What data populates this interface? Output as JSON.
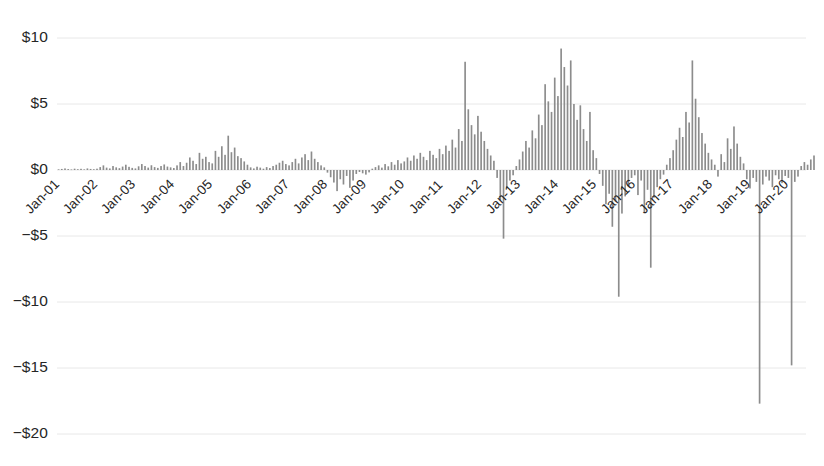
{
  "chart_data": {
    "type": "bar",
    "title": "",
    "subtitle": "",
    "xlabel": "",
    "ylabel": "",
    "ylim": [
      -20,
      11.5
    ],
    "xlim": [
      0,
      234
    ],
    "grid": true,
    "legend": false,
    "legend_position": "none",
    "bar_color": "#8c8c8c",
    "grid_color": "#e8e8e8",
    "axis_text_color": "#262626",
    "y_ticks": [
      10,
      5,
      0,
      -5,
      -10,
      -15,
      -20
    ],
    "y_tick_labels": [
      "$10",
      "$5",
      "$0",
      "−$5",
      "−$10",
      "−$15",
      "−$20"
    ],
    "x_tick_positions": [
      0,
      12,
      24,
      36,
      48,
      60,
      72,
      84,
      96,
      108,
      120,
      132,
      144,
      156,
      168,
      180,
      192,
      204,
      216,
      228
    ],
    "x_tick_labels": [
      "Jan-01",
      "Jan-02",
      "Jan-03",
      "Jan-04",
      "Jan-05",
      "Jan-06",
      "Jan-07",
      "Jan-08",
      "Jan-09",
      "Jan-10",
      "Jan-11",
      "Jan-12",
      "Jan-13",
      "Jan-14",
      "Jan-15",
      "Jan-16",
      "Jan-17",
      "Jan-18",
      "Jan-19",
      "Jan-20"
    ],
    "values": [
      0.05,
      0.08,
      0.12,
      0.07,
      0.04,
      0.1,
      0.06,
      0.09,
      0.05,
      0.12,
      0.08,
      0.06,
      0.1,
      0.22,
      0.35,
      0.18,
      0.12,
      0.3,
      0.2,
      0.14,
      0.26,
      0.4,
      0.24,
      0.16,
      0.12,
      0.28,
      0.45,
      0.3,
      0.18,
      0.36,
      0.22,
      0.16,
      0.3,
      0.42,
      0.26,
      0.2,
      0.15,
      0.35,
      0.6,
      0.3,
      0.55,
      0.95,
      0.7,
      0.45,
      1.3,
      0.85,
      1.0,
      0.6,
      0.5,
      1.45,
      1.0,
      1.8,
      1.15,
      2.6,
      1.35,
      1.7,
      1.05,
      0.9,
      0.65,
      0.4,
      0.2,
      0.12,
      0.25,
      0.18,
      0.1,
      0.22,
      0.15,
      0.3,
      0.4,
      0.55,
      0.7,
      0.45,
      0.35,
      0.6,
      0.85,
      0.5,
      0.95,
      1.2,
      0.75,
      1.4,
      0.85,
      0.6,
      0.35,
      0.2,
      -0.2,
      -0.55,
      -0.95,
      -1.6,
      -0.7,
      -1.1,
      -0.45,
      -1.35,
      -0.8,
      -0.3,
      -0.15,
      -0.25,
      -0.35,
      -0.18,
      0.1,
      0.22,
      0.35,
      0.18,
      0.45,
      0.28,
      0.6,
      0.4,
      0.75,
      0.5,
      0.65,
      0.95,
      0.7,
      1.1,
      0.85,
      1.3,
      1.0,
      0.75,
      1.45,
      1.15,
      0.9,
      1.6,
      1.2,
      1.85,
      1.45,
      2.3,
      1.7,
      3.1,
      2.2,
      8.2,
      4.6,
      3.4,
      2.7,
      4.1,
      2.9,
      2.2,
      1.6,
      1.1,
      0.7,
      -0.6,
      -2.3,
      -5.2,
      -1.4,
      -0.8,
      -0.4,
      0.3,
      0.8,
      1.4,
      2.2,
      1.7,
      3.0,
      2.4,
      4.2,
      3.4,
      6.5,
      5.2,
      4.4,
      7.0,
      5.6,
      9.2,
      7.8,
      6.4,
      8.3,
      5.0,
      3.8,
      4.9,
      3.1,
      2.2,
      4.4,
      1.5,
      0.9,
      -0.3,
      -1.2,
      -2.6,
      -1.8,
      -4.3,
      -2.4,
      -9.6,
      -3.3,
      -2.0,
      -1.2,
      -0.6,
      -0.4,
      -1.9,
      -0.8,
      -3.2,
      -1.5,
      -7.4,
      -2.1,
      -1.3,
      -0.7,
      -0.35,
      0.4,
      0.9,
      1.5,
      2.3,
      3.2,
      2.5,
      4.4,
      3.6,
      8.3,
      5.4,
      4.0,
      2.8,
      2.0,
      1.3,
      0.8,
      0.4,
      -0.5,
      1.2,
      0.6,
      2.4,
      1.6,
      3.3,
      2.0,
      1.0,
      0.5,
      -0.7,
      -1.4,
      -0.6,
      -0.9,
      -17.7,
      -1.1,
      -0.5,
      -0.8,
      -1.3,
      -0.4,
      -0.7,
      -1.0,
      -0.45,
      -0.6,
      -14.8,
      -0.9,
      -0.5,
      0.3,
      0.6,
      0.4,
      0.8,
      1.1
    ]
  }
}
